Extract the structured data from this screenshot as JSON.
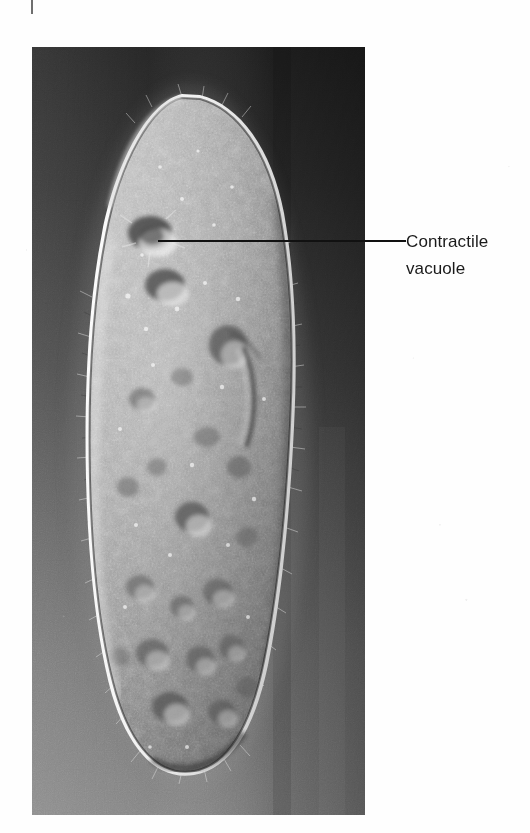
{
  "figure": {
    "kind": "light-micrograph",
    "technique": "differential-interference-contrast",
    "plate": {
      "x": 32,
      "y": 47,
      "width": 333,
      "height": 768,
      "background_tone_top_left": "#2b2b2b",
      "background_tone_top_right": "#0d0d0d",
      "background_tone_bottom_left": "#8a8a8a",
      "background_tone_bottom_right": "#6a6a6a",
      "cell_tone": "#9a9a9a",
      "cell_rim_tone": "#f2f2f2"
    },
    "crop_mark": {
      "name": "registration-tick",
      "x": 31,
      "y": 0,
      "width": 2,
      "height": 14,
      "color": "#6f6f6f"
    }
  },
  "annotations": [
    {
      "id": "contractile-vacuole",
      "label_line_1": "Contractile",
      "label_line_2": "vacuole",
      "leader": {
        "x1": 158,
        "y1": 241,
        "x2": 406,
        "y2": 241,
        "color": "#111111"
      },
      "label_position": {
        "x": 406,
        "y": 228
      },
      "target_point": {
        "x": 152,
        "y": 232
      }
    }
  ],
  "colors": {
    "page_background": "#fefefe",
    "text": "#1a1a1a",
    "leader_line": "#111111"
  }
}
